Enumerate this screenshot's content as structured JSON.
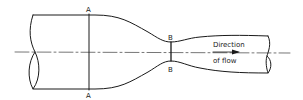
{
  "diagram": {
    "type": "venturi-meter-schematic",
    "stroke_color": "#1a1a1a",
    "background": "#ffffff",
    "sections": {
      "inlet": {
        "top_label": "A",
        "bottom_label": "A"
      },
      "throat": {
        "top_label": "B",
        "bottom_label": "B"
      }
    },
    "flow_annotation": {
      "line1": "Direction",
      "line2": "of flow",
      "arrow": "right-arrow"
    }
  }
}
